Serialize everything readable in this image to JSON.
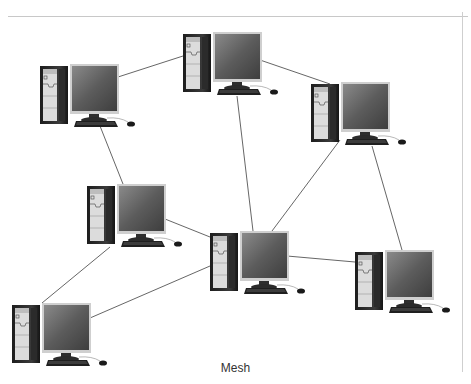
{
  "diagram": {
    "caption": "Mesh",
    "topology": "mesh",
    "line_color": "#555555",
    "nodes": [
      {
        "id": "pc1",
        "label": "",
        "x": 40,
        "y": 62
      },
      {
        "id": "pc2",
        "label": "",
        "x": 183,
        "y": 30
      },
      {
        "id": "pc3",
        "label": "",
        "x": 311,
        "y": 80
      },
      {
        "id": "pc4",
        "label": "",
        "x": 87,
        "y": 182
      },
      {
        "id": "pc5",
        "label": "",
        "x": 210,
        "y": 229
      },
      {
        "id": "pc6",
        "label": "",
        "x": 355,
        "y": 248
      },
      {
        "id": "pc7",
        "label": "",
        "x": 12,
        "y": 301
      }
    ],
    "edges": [
      [
        "pc1",
        "pc2"
      ],
      [
        "pc2",
        "pc3"
      ],
      [
        "pc1",
        "pc4"
      ],
      [
        "pc2",
        "pc5"
      ],
      [
        "pc3",
        "pc5"
      ],
      [
        "pc3",
        "pc6"
      ],
      [
        "pc4",
        "pc5"
      ],
      [
        "pc4",
        "pc7"
      ],
      [
        "pc5",
        "pc6"
      ],
      [
        "pc5",
        "pc7"
      ]
    ]
  }
}
